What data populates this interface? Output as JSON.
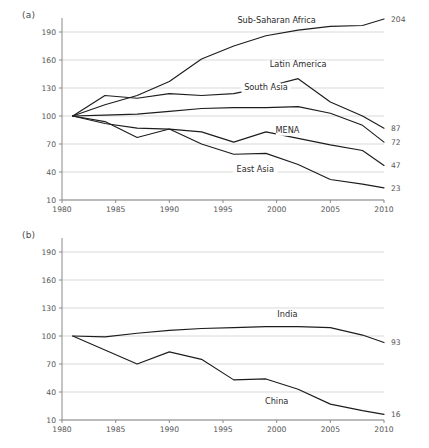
{
  "figure": {
    "panels": [
      {
        "tag": "(a)",
        "name": "panel-a"
      },
      {
        "tag": "(b)",
        "name": "panel-b"
      }
    ]
  },
  "chart_data": [
    {
      "type": "line",
      "panel": "(a)",
      "title": "",
      "xlabel": "",
      "ylabel": "",
      "xlim": [
        1980,
        2010
      ],
      "ylim": [
        10,
        205
      ],
      "grid": true,
      "legend": "inline-labels",
      "xticks": [
        "1980",
        "1985",
        "1990",
        "1995",
        "2000",
        "2005",
        "2010"
      ],
      "yticks": [
        "10",
        "40",
        "70",
        "100",
        "130",
        "160",
        "190"
      ],
      "x": [
        1981,
        1984,
        1987,
        1990,
        1993,
        1996,
        1999,
        2002,
        2005,
        2008,
        2010
      ],
      "series": [
        {
          "name": "Sub-Saharan Africa",
          "end_value": "204",
          "label_x": 2000,
          "label_y": 200,
          "values": [
            100,
            112,
            122,
            137,
            161,
            175,
            186,
            192,
            196,
            197,
            204
          ]
        },
        {
          "name": "Latin America",
          "end_value": "87",
          "label_x": 2002,
          "label_y": 152,
          "values": [
            100,
            122,
            119,
            124,
            122,
            124,
            131,
            140,
            115,
            100,
            87
          ]
        },
        {
          "name": "South Asia",
          "end_value": "72",
          "label_x": 1999,
          "label_y": 128,
          "values": [
            100,
            101,
            102,
            105,
            108,
            109,
            109,
            110,
            103,
            90,
            72
          ]
        },
        {
          "name": "MENA",
          "end_value": "47",
          "label_x": 2001,
          "label_y": 82,
          "values": [
            100,
            94,
            77,
            86,
            83,
            72,
            83,
            76,
            69,
            63,
            47
          ]
        },
        {
          "name": "East Asia",
          "end_value": "23",
          "label_x": 1998,
          "label_y": 40,
          "values": [
            100,
            92,
            87,
            86,
            70,
            59,
            60,
            48,
            32,
            27,
            23
          ]
        }
      ]
    },
    {
      "type": "line",
      "panel": "(b)",
      "title": "",
      "xlabel": "",
      "ylabel": "",
      "xlim": [
        1980,
        2010
      ],
      "ylim": [
        10,
        205
      ],
      "grid": true,
      "legend": "inline-labels",
      "xticks": [
        "1980",
        "1985",
        "1990",
        "1995",
        "2000",
        "2005",
        "2010"
      ],
      "yticks": [
        "10",
        "40",
        "70",
        "100",
        "130",
        "160",
        "190"
      ],
      "x": [
        1981,
        1984,
        1987,
        1990,
        1993,
        1996,
        1999,
        2002,
        2005,
        2008,
        2010
      ],
      "series": [
        {
          "name": "India",
          "end_value": "93",
          "label_x": 2001,
          "label_y": 120,
          "values": [
            100,
            99,
            103,
            106,
            108,
            109,
            110,
            110,
            109,
            101,
            93
          ]
        },
        {
          "name": "China",
          "end_value": "16",
          "label_x": 2000,
          "label_y": 27,
          "values": [
            100,
            85,
            70,
            83,
            75,
            53,
            54,
            43,
            27,
            20,
            16
          ]
        }
      ]
    }
  ]
}
